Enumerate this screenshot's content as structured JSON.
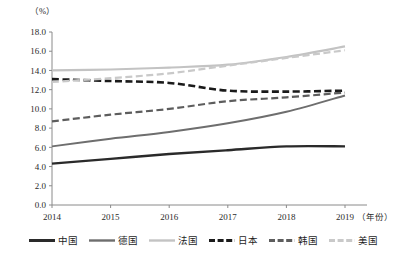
{
  "chart_data": {
    "type": "line",
    "title": "",
    "xlabel": "（年份）",
    "ylabel": "（%）",
    "x": [
      2014,
      2015,
      2016,
      2017,
      2018,
      2019
    ],
    "categories": [
      "2014",
      "2015",
      "2016",
      "2017",
      "2018",
      "2019"
    ],
    "xtick_labels": [
      "2014",
      "2015",
      "2016",
      "2017",
      "2018",
      "2019"
    ],
    "ytick_labels": [
      "0.0",
      "2.0",
      "4.0",
      "6.0",
      "8.0",
      "10.0",
      "12.0",
      "14.0",
      "16.0",
      "18.0"
    ],
    "yticks": [
      0.0,
      2.0,
      4.0,
      6.0,
      8.0,
      10.0,
      12.0,
      14.0,
      16.0,
      18.0
    ],
    "ylim": [
      0.0,
      18.0
    ],
    "xlim": [
      2014,
      2019
    ],
    "grid": false,
    "legend_position": "bottom",
    "series": [
      {
        "name": "中国",
        "values": [
          4.3,
          4.8,
          5.3,
          5.7,
          6.1,
          6.1
        ],
        "color": "#2a2a2a",
        "style": "solid",
        "width": 2.4
      },
      {
        "name": "德国",
        "values": [
          6.1,
          6.9,
          7.6,
          8.5,
          9.7,
          11.4
        ],
        "color": "#6e6e6e",
        "style": "solid",
        "width": 2.0
      },
      {
        "name": "法国",
        "values": [
          14.0,
          14.1,
          14.3,
          14.6,
          15.4,
          16.5
        ],
        "color": "#c3c3c3",
        "style": "solid",
        "width": 2.2
      },
      {
        "name": "日本",
        "values": [
          13.1,
          12.9,
          12.7,
          11.9,
          11.8,
          11.9
        ],
        "color": "#1a1a1a",
        "style": "dashed",
        "width": 2.6
      },
      {
        "name": "韩国",
        "values": [
          8.7,
          9.4,
          10.0,
          10.8,
          11.2,
          11.7
        ],
        "color": "#5d5d5d",
        "style": "dashed",
        "width": 2.2
      },
      {
        "name": "美国",
        "values": [
          12.8,
          13.2,
          13.7,
          14.5,
          15.3,
          16.1
        ],
        "color": "#c9c9c9",
        "style": "dashed",
        "width": 2.2
      }
    ],
    "legend": [
      {
        "label": "中国",
        "color": "#2a2a2a",
        "style": "solid"
      },
      {
        "label": "德国",
        "color": "#6e6e6e",
        "style": "solid"
      },
      {
        "label": "法国",
        "color": "#c3c3c3",
        "style": "solid"
      },
      {
        "label": "日本",
        "color": "#1a1a1a",
        "style": "dashed"
      },
      {
        "label": "韩国",
        "color": "#5d5d5d",
        "style": "dashed"
      },
      {
        "label": "美国",
        "color": "#c9c9c9",
        "style": "dashed"
      }
    ],
    "axis_color": "#8a8a8a"
  }
}
